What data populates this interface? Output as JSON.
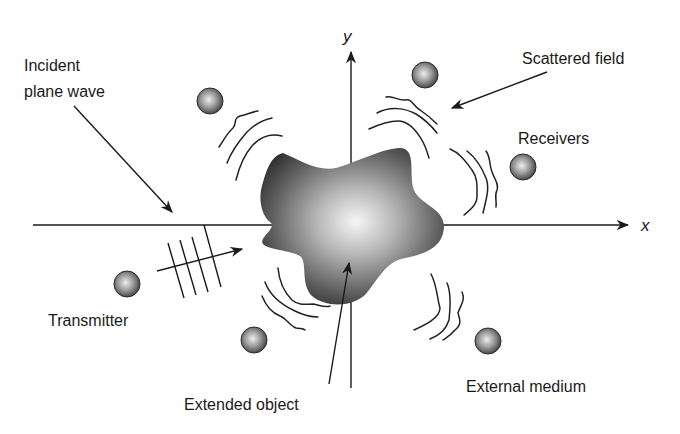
{
  "diagram": {
    "axes": {
      "x_label": "x",
      "y_label": "y"
    },
    "labels": {
      "incident_line1": "Incident",
      "incident_line2": "plane wave",
      "scattered_field": "Scattered field",
      "receivers": "Receivers",
      "transmitter": "Transmitter",
      "extended_object": "Extended object",
      "external_medium": "External medium"
    },
    "elements": {
      "transmitter_count": 1,
      "receiver_count": 5,
      "plane_wave_fronts": 4
    },
    "colors": {
      "ink": "#1a1a1a",
      "object_dark": "#2a2a2a",
      "object_light": "#f4f4f4",
      "sphere_dark": "#3a3a3a",
      "sphere_light": "#e8e8e8",
      "background": "#ffffff"
    }
  }
}
